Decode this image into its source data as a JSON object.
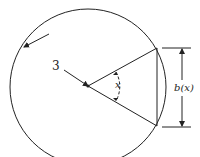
{
  "diagram": {
    "radius_label": "3",
    "angle_label": "x",
    "chord_label": "b(x)",
    "stroke_color": "#222222",
    "background": "#ffffff"
  }
}
